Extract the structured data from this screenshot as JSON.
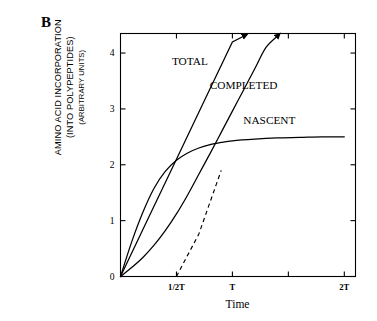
{
  "figure": {
    "panel_label": "B",
    "x_axis_title": "Time",
    "y_axis_title_line1": "AMINO ACID INCORPORATION",
    "y_axis_title_line2": "(INTO POLYPEPTIDES)",
    "y_axis_title_line3": "(ARBITRARY UNITS)"
  },
  "chart_data": {
    "type": "line",
    "title": "B",
    "xlabel": "Time",
    "ylabel": "AMINO ACID INCORPORATION (INTO POLYPEPTIDES) (ARBITRARY UNITS)",
    "grid": false,
    "legend_position": "inline-labels",
    "xlim": [
      0,
      2.1
    ],
    "ylim": [
      0,
      4.35
    ],
    "x_tick_values": [
      0.5,
      1.0,
      1.5,
      2.0
    ],
    "x_tick_labels": [
      "1/2T",
      "T",
      "",
      "2T"
    ],
    "y_tick_values": [
      0,
      1,
      2,
      3,
      4
    ],
    "y_tick_labels": [
      "0",
      "1",
      "2",
      "3",
      "4"
    ],
    "series": [
      {
        "name": "TOTAL",
        "label": "TOTAL",
        "style": "solid-straight-arrow",
        "description": "straight line from origin rising steeply, arrowhead at end",
        "x": [
          0,
          0.25,
          0.5,
          0.75,
          1.0,
          1.1
        ],
        "values": [
          0,
          1.05,
          2.1,
          3.15,
          4.2,
          4.3
        ]
      },
      {
        "name": "NASCENT",
        "label": "NASCENT",
        "style": "solid-saturating",
        "description": "saturating curve rising from origin, plateau near 2.5",
        "x": [
          0,
          0.1,
          0.2,
          0.3,
          0.4,
          0.5,
          0.6,
          0.7,
          0.8,
          0.9,
          1.0,
          1.2,
          1.4,
          1.6,
          1.8,
          2.0
        ],
        "values": [
          0,
          0.62,
          1.15,
          1.58,
          1.88,
          2.08,
          2.21,
          2.3,
          2.36,
          2.4,
          2.43,
          2.46,
          2.48,
          2.49,
          2.5,
          2.5
        ]
      },
      {
        "name": "COMPLETED",
        "label": "COMPLETED",
        "style": "solid-sigmoid-arrow",
        "description": "sigmoidal curve with lag phase from origin, arrowhead at end",
        "x": [
          0,
          0.1,
          0.2,
          0.3,
          0.4,
          0.5,
          0.6,
          0.7,
          0.8,
          0.9,
          1.0,
          1.1,
          1.2,
          1.3,
          1.4
        ],
        "values": [
          0,
          0.16,
          0.34,
          0.56,
          0.82,
          1.12,
          1.46,
          1.83,
          2.2,
          2.58,
          2.96,
          3.34,
          3.72,
          4.1,
          4.3
        ]
      },
      {
        "name": "COMPLETED-extrapolation",
        "label": "",
        "style": "dashed",
        "description": "dashed tangent extrapolation of COMPLETED curve intersecting x-axis at 1/2T",
        "x": [
          0.5,
          0.7,
          0.9
        ],
        "values": [
          0,
          0.76,
          1.9
        ]
      }
    ],
    "annotations": [
      {
        "text": "TOTAL",
        "x": 0.62,
        "y": 3.78
      },
      {
        "text": "COMPLETED",
        "x": 1.1,
        "y": 3.35
      },
      {
        "text": "NASCENT",
        "x": 1.33,
        "y": 2.73
      }
    ]
  }
}
